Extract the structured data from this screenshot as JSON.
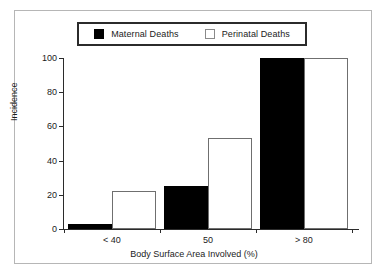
{
  "chart_data": {
    "type": "bar",
    "title": "",
    "xlabel": "Body Surface Area Involved (%)",
    "ylabel": "Incidence",
    "categories": [
      "< 40",
      "50",
      "> 80"
    ],
    "series": [
      {
        "name": "Maternal Deaths",
        "values": [
          3,
          25,
          100
        ],
        "swatch": "filled",
        "color": "#000000"
      },
      {
        "name": "Perinatal Deaths",
        "values": [
          22,
          53,
          100
        ],
        "swatch": "open",
        "color": "#ffffff"
      }
    ],
    "ylim": [
      0,
      100
    ],
    "yticks": [
      0,
      20,
      40,
      60,
      80,
      100
    ],
    "ytick_labels": [
      "0",
      "20",
      "40",
      "60",
      "80",
      "100"
    ],
    "grid": false,
    "legend_position": "top-center",
    "legend_boxed": true
  },
  "legend": {
    "entries": [
      {
        "label": "Maternal Deaths",
        "swatch": "filled-square-icon"
      },
      {
        "label": "Perinatal Deaths",
        "swatch": "open-square-icon"
      }
    ]
  },
  "axes": {
    "y_title": "Incidence",
    "x_title": "Body Surface Area Involved (%)",
    "y_labels": [
      "100",
      "80",
      "60",
      "40",
      "20",
      "0"
    ],
    "x_labels": [
      "< 40",
      "50",
      "> 80"
    ]
  },
  "colors": {
    "maternal": "#000000",
    "perinatal": "#ffffff",
    "axis": "#2b2b2b",
    "frame": "#b6b6b6",
    "text": "#1b1b1b"
  }
}
